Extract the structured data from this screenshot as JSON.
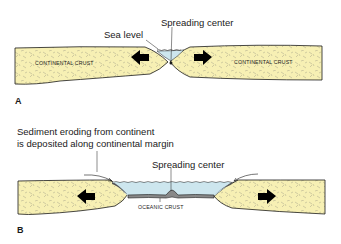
{
  "panel_a": {
    "letter": "A",
    "labels": {
      "spreading_center": "Spreading center",
      "sea_level": "Sea level",
      "left_crust": "CONTINENTAL CRUST",
      "right_crust": "CONTINENTAL CRUST"
    }
  },
  "panel_b": {
    "letter": "B",
    "labels": {
      "sediment_line1": "Sediment eroding from continent",
      "sediment_line2": "is deposited along continental margin",
      "spreading_center": "Spreading center",
      "oceanic_crust": "OCEANIC CRUST"
    }
  },
  "colors": {
    "crust_fill": "#f7f0b4",
    "water_fill": "#cde6ee",
    "outline": "#1a1a1a",
    "arrow": "#000000"
  }
}
